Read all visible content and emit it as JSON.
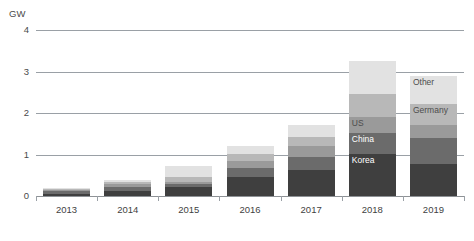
{
  "chart_data": {
    "type": "bar",
    "title": "",
    "subtitle": "",
    "xlabel": "",
    "ylabel": "GW",
    "unit_label": "GW",
    "stacked": true,
    "grid": true,
    "legend_position": "in-chart-labels",
    "ylim": [
      0,
      4
    ],
    "yticks": [
      "0",
      "1",
      "2",
      "3",
      "4"
    ],
    "ytick_values": [
      0,
      1,
      2,
      3,
      4
    ],
    "categories": [
      "2013",
      "2014",
      "2015",
      "2016",
      "2017",
      "2018",
      "2019"
    ],
    "series": [
      {
        "name": "Korea",
        "color": "#3f3f3f",
        "values": [
          0.06,
          0.12,
          0.22,
          0.46,
          0.62,
          1.02,
          0.78
        ]
      },
      {
        "name": "China",
        "color": "#6b6b6b",
        "values": [
          0.05,
          0.09,
          0.07,
          0.22,
          0.33,
          0.5,
          0.62
        ]
      },
      {
        "name": "US",
        "color": "#9a9a9a",
        "values": [
          0.04,
          0.07,
          0.06,
          0.17,
          0.26,
          0.38,
          0.3
        ]
      },
      {
        "name": "Germany",
        "color": "#b8b8b8",
        "values": [
          0.03,
          0.05,
          0.12,
          0.16,
          0.22,
          0.55,
          0.52
        ]
      },
      {
        "name": "Other",
        "color": "#e2e2e2",
        "values": [
          0.02,
          0.05,
          0.25,
          0.19,
          0.29,
          0.8,
          0.68
        ]
      }
    ],
    "totals": [
      0.2,
      0.38,
      0.72,
      1.2,
      1.72,
      3.25,
      2.9
    ],
    "annotations": [
      {
        "text": "US",
        "category": "2018",
        "series": "US"
      },
      {
        "text": "China",
        "category": "2018",
        "series": "China"
      },
      {
        "text": "Korea",
        "category": "2018",
        "series": "Korea"
      },
      {
        "text": "Other",
        "category": "2019",
        "series": "Other"
      },
      {
        "text": "Germany",
        "category": "2019",
        "series": "Germany"
      }
    ]
  },
  "axis": {
    "unit": "GW",
    "yticks": [
      {
        "label": "4",
        "value": 4
      },
      {
        "label": "3",
        "value": 3
      },
      {
        "label": "2",
        "value": 2
      },
      {
        "label": "1",
        "value": 1
      },
      {
        "label": "0",
        "value": 0
      }
    ],
    "xticks": [
      {
        "label": "2013"
      },
      {
        "label": "2014"
      },
      {
        "label": "2015"
      },
      {
        "label": "2016"
      },
      {
        "label": "2017"
      },
      {
        "label": "2018"
      },
      {
        "label": "2019"
      }
    ]
  },
  "colors": {
    "gridline": "#9aa0a6",
    "axis_text": "#4a4a4a",
    "background": "#ffffff"
  }
}
